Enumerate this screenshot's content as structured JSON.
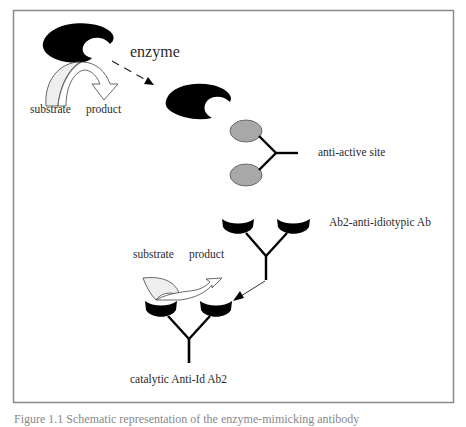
{
  "figure": {
    "frame": {
      "stroke": "#8a8a8a",
      "fill": "#ffffff"
    },
    "colors": {
      "enzyme": "#000000",
      "antibody": "#000000",
      "ellipse_fill": "#a8a8a8",
      "ellipse_stroke": "#555555",
      "arrow_fill": "#ffffff",
      "substrate_fill": "#eeeeee",
      "text": "#2a2a2a"
    },
    "labels": {
      "enzyme": "enzyme",
      "substrate_top": "substrate",
      "product_top": "product",
      "anti_active_site": "anti-active site",
      "ab2": "Ab2-anti-idiotypic Ab",
      "substrate_bottom": "substrate",
      "product_bottom": "product",
      "catalytic": "catalytic Anti-Id Ab2"
    },
    "caption": "Figure 1.1  Schematic representation of the enzyme-mimicking antibody"
  }
}
